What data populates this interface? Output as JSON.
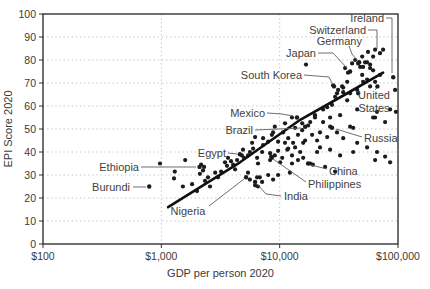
{
  "colors": {
    "background": "#ffffff",
    "point": "#1b1b1b",
    "trend_line": "#101010",
    "plot_border": "#333333",
    "gridline": "#c2c2c2",
    "tick_text": "#3a3a3a",
    "axis_title": "#3a3a3a",
    "country_label": "#3f3f3f",
    "leader_line": "#5f5f5f"
  },
  "chart_data": {
    "type": "scatter",
    "title": "",
    "xlabel": "GDP per person 2020",
    "ylabel": "EPI Score 2020",
    "x_scale": "log",
    "xlim": [
      100,
      100000
    ],
    "ylim": [
      0,
      100
    ],
    "grid": "dotted",
    "legend": "none",
    "x_ticks": [
      {
        "value": 100,
        "label": "$100"
      },
      {
        "value": 1000,
        "label": "$1,000"
      },
      {
        "value": 10000,
        "label": "$10,000"
      },
      {
        "value": 100000,
        "label": "$100,000"
      }
    ],
    "y_ticks": [
      {
        "value": 0,
        "label": "0"
      },
      {
        "value": 10,
        "label": "10"
      },
      {
        "value": 20,
        "label": "20"
      },
      {
        "value": 30,
        "label": "30"
      },
      {
        "value": 40,
        "label": "40"
      },
      {
        "value": 50,
        "label": "50"
      },
      {
        "value": 60,
        "label": "60"
      },
      {
        "value": 70,
        "label": "70"
      },
      {
        "value": 80,
        "label": "80"
      },
      {
        "value": 90,
        "label": "90"
      },
      {
        "value": 100,
        "label": "100"
      }
    ],
    "x_gridlines": [
      1000,
      10000
    ],
    "y_gridlines": [
      10,
      20,
      30,
      40,
      50,
      60,
      70,
      80,
      90
    ],
    "trendline": {
      "points": [
        [
          1140,
          16
        ],
        [
          4620,
          35.5
        ],
        [
          14900,
          54
        ],
        [
          35700,
          65
        ],
        [
          74800,
          74.5
        ]
      ]
    },
    "labeled_points": [
      {
        "name": "Ireland",
        "gdp": 91000,
        "epi": 72.5,
        "label_lines": [
          "Ireland"
        ],
        "label_x": 384,
        "label_y": 18,
        "anchor": "end",
        "leader": [
          [
            386,
            18
          ],
          [
            392,
            18
          ],
          [
            392,
            73
          ]
        ]
      },
      {
        "name": "Switzerland",
        "gdp": 70500,
        "epi": 83,
        "label_lines": [
          "Switzerland"
        ],
        "label_x": 366,
        "label_y": 30,
        "anchor": "end",
        "leader": [
          [
            368,
            30
          ],
          [
            377,
            30
          ],
          [
            377,
            49
          ]
        ]
      },
      {
        "name": "Germany",
        "gdp": 47000,
        "epi": 79,
        "label_lines": [
          "Germany"
        ],
        "label_x": 362,
        "label_y": 41,
        "anchor": "end",
        "leader": [
          [
            349,
            46
          ],
          [
            352,
            54
          ],
          [
            357,
            60
          ]
        ]
      },
      {
        "name": "Japan",
        "gdp": 39400,
        "epi": 75,
        "label_lines": [
          "Japan"
        ],
        "label_x": 316,
        "label_y": 53,
        "anchor": "end",
        "leader": [
          [
            318,
            53
          ],
          [
            333,
            53
          ],
          [
            347,
            68
          ]
        ]
      },
      {
        "name": "South Korea",
        "gdp": 28800,
        "epi": 68.5,
        "label_lines": [
          "South Korea"
        ],
        "label_x": 302,
        "label_y": 75,
        "anchor": "end",
        "leader": [
          [
            304,
            75
          ],
          [
            329,
            77
          ],
          [
            332,
            83
          ]
        ]
      },
      {
        "name": "United States",
        "gdp": 67000,
        "epi": 68.5,
        "label_lines": [
          "United",
          "States"
        ],
        "label_x": 374,
        "label_y": 95,
        "anchor": "middle",
        "leader": [
          [
            375,
            90
          ],
          [
            377,
            88
          ]
        ]
      },
      {
        "name": "Mexico",
        "gdp": 14000,
        "epi": 55,
        "label_lines": [
          "Mexico"
        ],
        "label_x": 265,
        "label_y": 113,
        "anchor": "end",
        "leader": [
          [
            267,
            113
          ],
          [
            282,
            114
          ],
          [
            293,
            116
          ]
        ]
      },
      {
        "name": "Brazil",
        "gdp": 16400,
        "epi": 51,
        "label_lines": [
          "Brazil"
        ],
        "label_x": 253,
        "label_y": 130,
        "anchor": "end",
        "leader": [
          [
            255,
            130
          ],
          [
            301,
            128
          ]
        ]
      },
      {
        "name": "Russia",
        "gdp": 27700,
        "epi": 50.5,
        "label_lines": [
          "Russia"
        ],
        "label_x": 364,
        "label_y": 138,
        "anchor": "start",
        "leader": [
          [
            362,
            137
          ],
          [
            336,
            129
          ]
        ]
      },
      {
        "name": "China",
        "gdp": 17400,
        "epi": 35,
        "label_lines": [
          "China"
        ],
        "label_x": 329,
        "label_y": 171,
        "anchor": "start",
        "leader": [
          [
            327,
            169
          ],
          [
            311,
            165
          ]
        ]
      },
      {
        "name": "Philippines",
        "gdp": 8500,
        "epi": 38,
        "label_lines": [
          "Philippines"
        ],
        "label_x": 308,
        "label_y": 184,
        "anchor": "start",
        "leader": [
          [
            306,
            182
          ],
          [
            273,
            159
          ]
        ]
      },
      {
        "name": "India",
        "gdp": 6200,
        "epi": 27,
        "label_lines": [
          "India"
        ],
        "label_x": 284,
        "label_y": 196,
        "anchor": "start",
        "leader": [
          [
            281,
            196
          ],
          [
            266,
            194
          ],
          [
            257,
            184
          ]
        ]
      },
      {
        "name": "Egypt",
        "gdp": 4600,
        "epi": 39,
        "label_lines": [
          "Egypt"
        ],
        "label_x": 226,
        "label_y": 153,
        "anchor": "end",
        "leader": [
          [
            228,
            153
          ],
          [
            237,
            154
          ]
        ]
      },
      {
        "name": "Ethiopia",
        "gdp": 2100,
        "epi": 33.5,
        "label_lines": [
          "Ethiopia"
        ],
        "label_x": 139,
        "label_y": 167,
        "anchor": "end",
        "leader": [
          [
            141,
            167
          ],
          [
            196,
            167
          ]
        ]
      },
      {
        "name": "Burundi",
        "gdp": 790,
        "epi": 25,
        "label_lines": [
          "Burundi"
        ],
        "label_x": 130,
        "label_y": 187,
        "anchor": "end",
        "leader": [
          [
            133,
            187
          ],
          [
            146,
            187
          ]
        ]
      },
      {
        "name": "Nigeria",
        "gdp": 5200,
        "epi": 29,
        "label_lines": [
          "Nigeria"
        ],
        "label_x": 188,
        "label_y": 211,
        "anchor": "middle",
        "leader": [
          [
            209,
            206
          ],
          [
            244,
            179
          ]
        ]
      }
    ],
    "points": [
      [
        975,
        35
      ],
      [
        1280,
        28.5
      ],
      [
        1300,
        31.5
      ],
      [
        1520,
        25
      ],
      [
        1590,
        36.5
      ],
      [
        1820,
        26
      ],
      [
        2000,
        23
      ],
      [
        2120,
        30.5
      ],
      [
        2170,
        34.5
      ],
      [
        2250,
        32
      ],
      [
        2300,
        33.5
      ],
      [
        2340,
        27.5
      ],
      [
        2480,
        29
      ],
      [
        2580,
        25
      ],
      [
        2850,
        31
      ],
      [
        3010,
        29
      ],
      [
        3200,
        31.5
      ],
      [
        3450,
        35.5
      ],
      [
        3590,
        34
      ],
      [
        3660,
        37.5
      ],
      [
        3880,
        36
      ],
      [
        4040,
        34.5
      ],
      [
        4200,
        32.5
      ],
      [
        4370,
        36.5
      ],
      [
        4800,
        38.5
      ],
      [
        4900,
        41
      ],
      [
        5000,
        37.5
      ],
      [
        5400,
        38.5
      ],
      [
        5400,
        31
      ],
      [
        5600,
        40
      ],
      [
        5600,
        28
      ],
      [
        5850,
        44
      ],
      [
        5960,
        41.5
      ],
      [
        6200,
        46.5
      ],
      [
        6200,
        25.5
      ],
      [
        6440,
        37.5
      ],
      [
        6440,
        29
      ],
      [
        6560,
        35
      ],
      [
        6560,
        25
      ],
      [
        6800,
        29
      ],
      [
        7100,
        27
      ],
      [
        7100,
        40
      ],
      [
        7240,
        43
      ],
      [
        7240,
        46
      ],
      [
        8000,
        30
      ],
      [
        8000,
        44.5
      ],
      [
        8300,
        36.5
      ],
      [
        8300,
        39.5
      ],
      [
        8600,
        37.5
      ],
      [
        8600,
        47.5
      ],
      [
        8800,
        28
      ],
      [
        8800,
        48.5
      ],
      [
        9100,
        38.5
      ],
      [
        9100,
        51
      ],
      [
        9700,
        40.5
      ],
      [
        9700,
        30
      ],
      [
        9700,
        44.5
      ],
      [
        10100,
        35.5
      ],
      [
        10500,
        37.5
      ],
      [
        10700,
        48.5
      ],
      [
        11100,
        44
      ],
      [
        11100,
        52.5
      ],
      [
        11600,
        41
      ],
      [
        11800,
        41.5
      ],
      [
        11800,
        46
      ],
      [
        12200,
        31
      ],
      [
        12700,
        38.5
      ],
      [
        12700,
        35
      ],
      [
        12700,
        55
      ],
      [
        13000,
        44
      ],
      [
        13500,
        42
      ],
      [
        13500,
        50.5
      ],
      [
        14300,
        36.5
      ],
      [
        14300,
        47.5
      ],
      [
        14900,
        40
      ],
      [
        15500,
        49.5
      ],
      [
        15500,
        52.5
      ],
      [
        15800,
        44
      ],
      [
        15800,
        37.5
      ],
      [
        16400,
        45
      ],
      [
        16700,
        78
      ],
      [
        17400,
        51.5
      ],
      [
        18100,
        35
      ],
      [
        18100,
        53
      ],
      [
        18800,
        47.5
      ],
      [
        19100,
        34.5
      ],
      [
        19900,
        56
      ],
      [
        19900,
        55
      ],
      [
        20700,
        40
      ],
      [
        20700,
        45
      ],
      [
        21900,
        48.5
      ],
      [
        21900,
        42
      ],
      [
        23300,
        58.5
      ],
      [
        23300,
        53
      ],
      [
        24200,
        33.5
      ],
      [
        25200,
        46.5
      ],
      [
        25200,
        59.5
      ],
      [
        26700,
        51
      ],
      [
        26700,
        41
      ],
      [
        26700,
        55
      ],
      [
        27700,
        60.5
      ],
      [
        28300,
        69
      ],
      [
        29400,
        31.5
      ],
      [
        29400,
        64
      ],
      [
        30500,
        48.5
      ],
      [
        30500,
        65.5
      ],
      [
        31200,
        67
      ],
      [
        32400,
        56
      ],
      [
        32400,
        38.5
      ],
      [
        33700,
        68.5
      ],
      [
        34400,
        46
      ],
      [
        34400,
        66
      ],
      [
        34400,
        68
      ],
      [
        35700,
        76.5
      ],
      [
        37200,
        62.5
      ],
      [
        37200,
        70.5
      ],
      [
        37800,
        74.5
      ],
      [
        39400,
        51
      ],
      [
        39400,
        65.5
      ],
      [
        40900,
        78.5
      ],
      [
        41800,
        50.5
      ],
      [
        41800,
        40
      ],
      [
        43500,
        80
      ],
      [
        45200,
        58.5
      ],
      [
        45200,
        67
      ],
      [
        45200,
        44
      ],
      [
        46000,
        65.5
      ],
      [
        46000,
        78.5
      ],
      [
        47900,
        77
      ],
      [
        49800,
        81.5
      ],
      [
        49800,
        73.5
      ],
      [
        50700,
        70.5
      ],
      [
        50700,
        77
      ],
      [
        52700,
        79
      ],
      [
        54800,
        42
      ],
      [
        54800,
        71.5
      ],
      [
        54800,
        79
      ],
      [
        55800,
        83.5
      ],
      [
        58100,
        76.5
      ],
      [
        58100,
        68.5
      ],
      [
        58100,
        78
      ],
      [
        61600,
        81.5
      ],
      [
        61600,
        75.5
      ],
      [
        61600,
        55
      ],
      [
        64000,
        84.5
      ],
      [
        64000,
        70.5
      ],
      [
        64000,
        55
      ],
      [
        64000,
        36.5
      ],
      [
        66500,
        57.5
      ],
      [
        66500,
        40
      ],
      [
        70500,
        73.5
      ],
      [
        74800,
        84.5
      ],
      [
        77800,
        38
      ],
      [
        77800,
        53
      ],
      [
        85700,
        35.5
      ],
      [
        85700,
        58.5
      ],
      [
        94600,
        67
      ],
      [
        96000,
        57.5
      ]
    ],
    "layout": {
      "canvas_width": 430,
      "canvas_height": 289,
      "plot_left": 43,
      "plot_top": 14,
      "plot_right": 398,
      "plot_bottom": 244,
      "point_radius": 2.1,
      "trend_width": 2.6
    }
  }
}
